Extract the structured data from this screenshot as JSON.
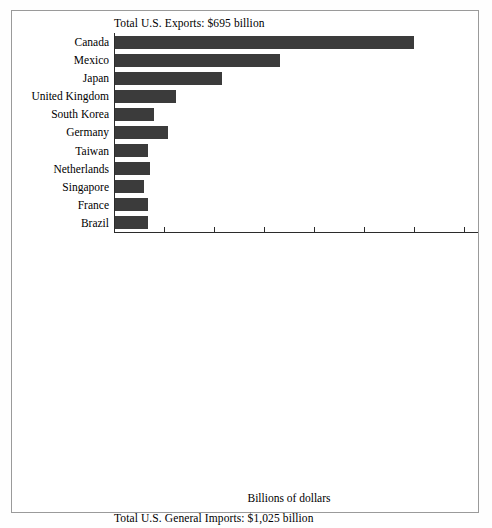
{
  "figure": {
    "background_color": "#ffffff",
    "frame_color": "#9a9a9a",
    "xlabel": "Billions of dollars"
  },
  "chart_data": [
    {
      "type": "bar",
      "orientation": "horizontal",
      "title": "Total U.S. Exports: $695 billion",
      "xlabel": "Billions of dollars",
      "ylabel": "",
      "xlim": [
        0,
        175
      ],
      "xticks": [
        0,
        25,
        50,
        75,
        100,
        125,
        150,
        175
      ],
      "xtick_labels": [
        "0",
        "25",
        "50",
        "75",
        "100",
        "125",
        "150",
        "175"
      ],
      "grid": false,
      "legend": null,
      "bar_color": "#3b3b3b",
      "categories": [
        "Canada",
        "Mexico",
        "Japan",
        "United Kingdom",
        "South Korea",
        "Germany",
        "Taiwan",
        "Netherlands",
        "Singapore",
        "France",
        "Brazil"
      ],
      "values": [
        150,
        83,
        54,
        31,
        20,
        27,
        17,
        18,
        15,
        17,
        17
      ]
    },
    {
      "type": "bar",
      "orientation": "horizontal",
      "title": "Total U.S. General Imports: $1,025 billion",
      "xlabel": "Billions of dollars",
      "ylabel": "",
      "xlim": [
        0,
        175
      ],
      "xticks": [
        0,
        25,
        50,
        75,
        100,
        125,
        150,
        175
      ],
      "xtick_labels": [
        "0",
        "25",
        "50",
        "75",
        "100",
        "125",
        "150",
        "175"
      ],
      "grid": false,
      "legend": null,
      "bar_color": "#080808",
      "categories": [
        "Canada",
        "Japan",
        "Mexico",
        "China",
        "Germany",
        "United Kingdom",
        "Taiwan",
        "South Korea",
        "France",
        "Singapore",
        "Italy"
      ],
      "values": [
        167,
        129,
        86,
        63,
        54,
        38,
        34,
        30,
        24,
        17,
        21
      ]
    }
  ]
}
